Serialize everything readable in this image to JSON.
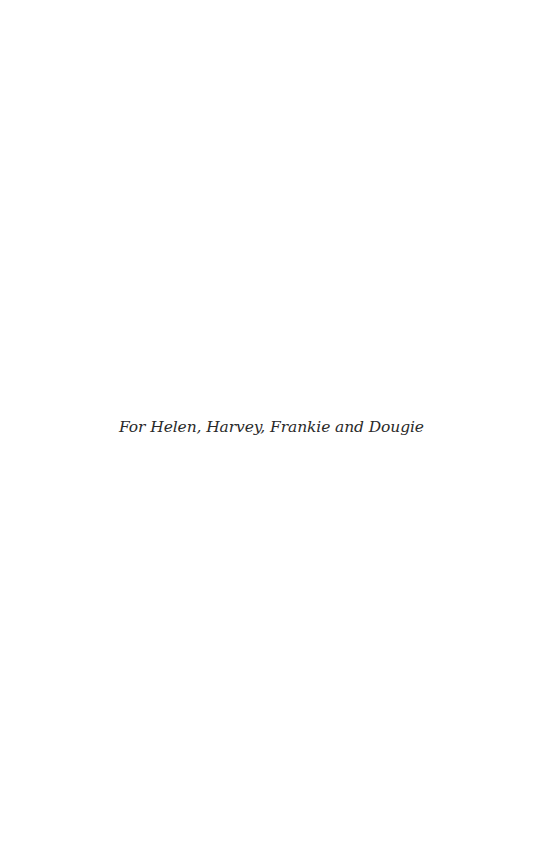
{
  "page": {
    "dedication": "For Helen, Harvey, Frankie and Dougie"
  }
}
